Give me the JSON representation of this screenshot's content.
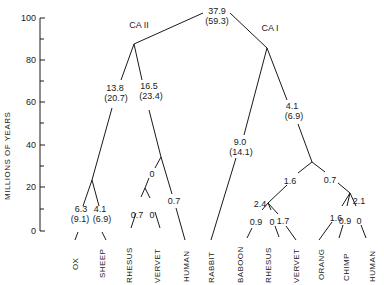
{
  "axis": {
    "label": "MILLIONS OF YEARS",
    "ticks": [
      "100",
      "80",
      "60",
      "40",
      "20",
      "0"
    ]
  },
  "clusters": {
    "left": "CA II",
    "right": "CA I"
  },
  "nodes": {
    "root": {
      "value": "37.9",
      "sub": "(59.3)"
    },
    "ca2_ungulate": {
      "value": "13.8",
      "sub": "(20.7)"
    },
    "ca2_primate": {
      "value": "16.5",
      "sub": "(23.4)"
    },
    "ox": {
      "value": "6.3",
      "sub": "(9.1)"
    },
    "sheep": {
      "value": "4.1",
      "sub": "(6.9)"
    },
    "ca2_monkey": "0",
    "ca2_human": "0.7",
    "ca2_rhesus": "0.7",
    "ca2_vervet": "0",
    "rabbit": {
      "value": "9.0",
      "sub": "(14.1)"
    },
    "ca1_primate": {
      "value": "4.1",
      "sub": "(6.9)"
    },
    "ca1_monkey": "1.6",
    "ca1_ape": "0.7",
    "ca1_monkey_node": "2.4",
    "ca1_ape_node": "2.1",
    "ca1_baboon": "0.9",
    "ca1_rhesus": "0",
    "ca1_vervet": "1.7",
    "ca1_orang": "1.6",
    "ca1_chimp": "0.9",
    "ca1_human": "0"
  },
  "taxa": [
    "OX",
    "SHEEP",
    "RHESUS",
    "VERVET",
    "HUMAN",
    "RABBIT",
    "BABOON",
    "RHESUS",
    "VERVET",
    "ORANG",
    "CHIMP",
    "HUMAN"
  ],
  "colors": {
    "line": "#1a1a1a",
    "background": "#ffffff"
  }
}
